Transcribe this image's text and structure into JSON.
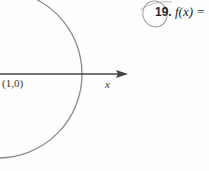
{
  "figure": {
    "point_label": "(1,0)",
    "axis_label": "x",
    "colors": {
      "circle": "#8a8a8a",
      "axis": "#444444",
      "pencil": "#9a9a9a"
    }
  },
  "problem": {
    "number": "19.",
    "expression": "f(x) ="
  }
}
